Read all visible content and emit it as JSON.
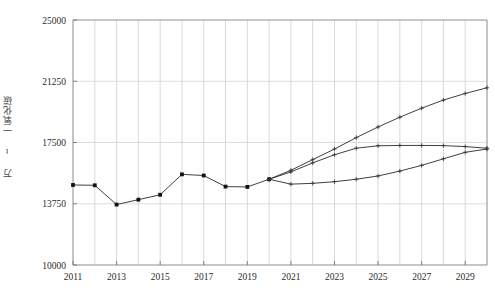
{
  "chart_data": {
    "type": "line",
    "title": "",
    "xlabel": "",
    "ylabel": "万 t 一氧化碳",
    "xlim": [
      2011,
      2030
    ],
    "ylim": [
      10000,
      25000
    ],
    "grid": true,
    "legend_position": "none",
    "x_tick_labels": [
      "2011",
      "2013",
      "2015",
      "2017",
      "2019",
      "2021",
      "2023",
      "2025",
      "2027",
      "2029"
    ],
    "x_tick_values": [
      2011,
      2013,
      2015,
      2017,
      2019,
      2021,
      2023,
      2025,
      2027,
      2029
    ],
    "y_tick_labels": [
      "10000",
      "13750",
      "17500",
      "21250",
      "25000"
    ],
    "y_tick_values": [
      10000,
      13750,
      17500,
      21250,
      25000
    ],
    "series": [
      {
        "name": "historical",
        "marker": "square",
        "x": [
          2011,
          2012,
          2013,
          2014,
          2015,
          2016,
          2017,
          2018,
          2019,
          2020
        ],
        "values": [
          14900,
          14880,
          13700,
          14000,
          14300,
          15550,
          15480,
          14800,
          14780,
          15250
        ]
      },
      {
        "name": "scenario-high",
        "marker": "cross",
        "x": [
          2020,
          2021,
          2022,
          2023,
          2024,
          2025,
          2026,
          2027,
          2028,
          2029,
          2030
        ],
        "values": [
          15250,
          15800,
          16450,
          17100,
          17800,
          18450,
          19050,
          19600,
          20100,
          20500,
          20850
        ]
      },
      {
        "name": "scenario-mid",
        "marker": "cross",
        "x": [
          2020,
          2021,
          2022,
          2023,
          2024,
          2025,
          2026,
          2027,
          2028,
          2029,
          2030
        ],
        "values": [
          15250,
          15700,
          16250,
          16750,
          17150,
          17300,
          17320,
          17320,
          17310,
          17250,
          17150
        ]
      },
      {
        "name": "scenario-low",
        "marker": "cross",
        "x": [
          2020,
          2021,
          2022,
          2023,
          2024,
          2025,
          2026,
          2027,
          2028,
          2029,
          2030
        ],
        "values": [
          15250,
          14950,
          15000,
          15100,
          15250,
          15450,
          15750,
          16100,
          16500,
          16900,
          17100
        ]
      }
    ]
  }
}
